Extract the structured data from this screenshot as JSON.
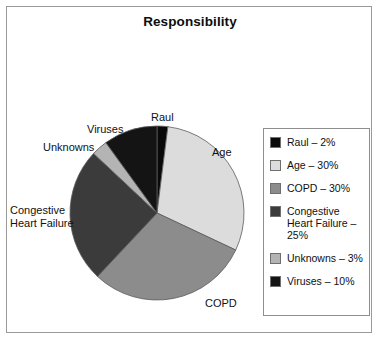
{
  "figure": {
    "title": "Responsibility",
    "background": "#ffffff",
    "frame_color": "#9a9a9a"
  },
  "chart_data": {
    "type": "pie",
    "title": "Responsibility",
    "xlabel": "",
    "ylabel": "",
    "legend_position": "right",
    "grid": false,
    "start_angle_deg": 0,
    "direction": "clockwise",
    "categories": [
      "Raul",
      "Age",
      "COPD",
      "Congestive Heart Failure",
      "Unknowns",
      "Viruses"
    ],
    "values": [
      2,
      30,
      30,
      25,
      3,
      10
    ],
    "units": "%",
    "colors": [
      "#0a0a0a",
      "#dcdcdc",
      "#8c8c8c",
      "#3b3b3b",
      "#b4b4b4",
      "#141414"
    ],
    "slices": [
      {
        "label": "Raul",
        "value": 2,
        "percent_text": "2%",
        "color": "#0a0a0a"
      },
      {
        "label": "Age",
        "value": 30,
        "percent_text": "30%",
        "color": "#dcdcdc"
      },
      {
        "label": "COPD",
        "value": 30,
        "percent_text": "30%",
        "color": "#8c8c8c"
      },
      {
        "label": "Congestive Heart Failure",
        "value": 25,
        "percent_text": "25%",
        "color": "#3b3b3b"
      },
      {
        "label": "Unknowns",
        "value": 3,
        "percent_text": "3%",
        "color": "#b4b4b4"
      },
      {
        "label": "Viruses",
        "value": 10,
        "percent_text": "10%",
        "color": "#141414"
      }
    ]
  },
  "pie_labels": {
    "raul": "Raul",
    "age": "Age",
    "copd": "COPD",
    "congestive_line1": "Congestive",
    "congestive_line2": "Heart Failure",
    "unknowns": "Unknowns",
    "viruses": "Viruses"
  },
  "legend": {
    "items": [
      {
        "label": "Raul – 2%",
        "color": "#0a0a0a"
      },
      {
        "label": "Age – 30%",
        "color": "#dcdcdc"
      },
      {
        "label": "COPD – 30%",
        "color": "#8c8c8c"
      },
      {
        "label": "Congestive Heart Failure – 25%",
        "color": "#3b3b3b"
      },
      {
        "label": "Unknowns – 3%",
        "color": "#b4b4b4"
      },
      {
        "label": "Viruses – 10%",
        "color": "#141414"
      }
    ]
  }
}
